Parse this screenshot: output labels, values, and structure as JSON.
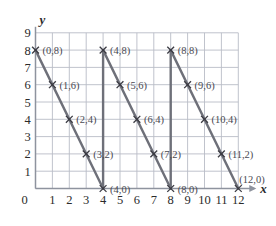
{
  "figure": {
    "type": "coordinate-grid-graph",
    "background_color": "#ffffff",
    "grid_color": "#b9bcc6",
    "axis_color": "#8e939e",
    "line_color": "#6e7079",
    "text_color": "#2b2b2b",
    "label_color": "#4a4a52"
  },
  "axes": {
    "x_axis_label": "x",
    "y_axis_label": "y",
    "x_ticks": [
      "1",
      "2",
      "3",
      "4",
      "5",
      "6",
      "7",
      "8",
      "9",
      "10",
      "11",
      "12"
    ],
    "y_ticks": [
      "1",
      "2",
      "3",
      "4",
      "5",
      "6",
      "7",
      "8",
      "9"
    ],
    "origin_label": "0",
    "x_min": 0,
    "x_max": 12,
    "y_min": 0,
    "y_max": 9,
    "x_arrow": true,
    "y_arrow": false,
    "grid": true
  },
  "chart_data": {
    "type": "line",
    "title": "",
    "xlabel": "x",
    "ylabel": "y",
    "xlim": [
      0,
      12
    ],
    "ylim": [
      0,
      9
    ],
    "grid": true,
    "legend": "none",
    "series": [
      {
        "name": "segment-1",
        "x": [
          0,
          4
        ],
        "y": [
          8,
          0
        ],
        "points": [
          [
            0,
            8
          ],
          [
            1,
            6
          ],
          [
            2,
            4
          ],
          [
            3,
            2
          ],
          [
            4,
            0
          ]
        ]
      },
      {
        "name": "jump-1",
        "x": [
          4,
          4
        ],
        "y": [
          0,
          8
        ],
        "points": [
          [
            4,
            0
          ],
          [
            4,
            8
          ]
        ]
      },
      {
        "name": "segment-2",
        "x": [
          4,
          8
        ],
        "y": [
          8,
          0
        ],
        "points": [
          [
            4,
            8
          ],
          [
            5,
            6
          ],
          [
            6,
            4
          ],
          [
            7,
            2
          ],
          [
            8,
            0
          ]
        ]
      },
      {
        "name": "jump-2",
        "x": [
          8,
          8
        ],
        "y": [
          0,
          8
        ],
        "points": [
          [
            8,
            0
          ],
          [
            8,
            8
          ]
        ]
      },
      {
        "name": "segment-3",
        "x": [
          8,
          12
        ],
        "y": [
          8,
          0
        ],
        "points": [
          [
            8,
            8
          ],
          [
            9,
            6
          ],
          [
            10,
            4
          ],
          [
            11,
            2
          ],
          [
            12,
            0
          ]
        ]
      }
    ],
    "marked_points": [
      {
        "label": "(0,8)",
        "x": 0,
        "y": 8,
        "label_dx": 7,
        "label_dy": 1
      },
      {
        "label": "(1,6)",
        "x": 1,
        "y": 6,
        "label_dx": 7,
        "label_dy": 1
      },
      {
        "label": "(2,4)",
        "x": 2,
        "y": 4,
        "label_dx": 7,
        "label_dy": 1
      },
      {
        "label": "(3,2)",
        "x": 3,
        "y": 2,
        "label_dx": 7,
        "label_dy": 1
      },
      {
        "label": "(4,0)",
        "x": 4,
        "y": 0,
        "label_dx": 7,
        "label_dy": 1
      },
      {
        "label": "(4,8)",
        "x": 4,
        "y": 8,
        "label_dx": 7,
        "label_dy": 1
      },
      {
        "label": "(5,6)",
        "x": 5,
        "y": 6,
        "label_dx": 7,
        "label_dy": 1
      },
      {
        "label": "(6,4)",
        "x": 6,
        "y": 4,
        "label_dx": 7,
        "label_dy": 1
      },
      {
        "label": "(7,2)",
        "x": 7,
        "y": 2,
        "label_dx": 7,
        "label_dy": 1
      },
      {
        "label": "(8,0)",
        "x": 8,
        "y": 0,
        "label_dx": 7,
        "label_dy": 1
      },
      {
        "label": "(8,8)",
        "x": 8,
        "y": 8,
        "label_dx": 7,
        "label_dy": 1
      },
      {
        "label": "(9,6)",
        "x": 9,
        "y": 6,
        "label_dx": 7,
        "label_dy": 1
      },
      {
        "label": "(10,4)",
        "x": 10,
        "y": 4,
        "label_dx": 7,
        "label_dy": 1
      },
      {
        "label": "(11,2)",
        "x": 11,
        "y": 2,
        "label_dx": 7,
        "label_dy": 1
      },
      {
        "label": "(12,0)",
        "x": 12,
        "y": 0,
        "label_dx": 1,
        "label_dy": -9
      }
    ]
  }
}
